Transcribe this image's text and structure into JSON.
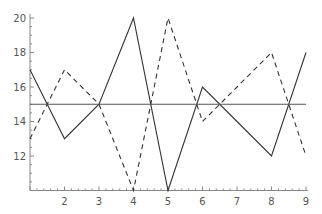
{
  "chart_data": {
    "type": "line",
    "title": "",
    "xlabel": "",
    "ylabel": "",
    "x": [
      1,
      2,
      3,
      4,
      5,
      6,
      7,
      8,
      9
    ],
    "series": [
      {
        "name": "solid",
        "style": "solid",
        "values": [
          17,
          13,
          15,
          20,
          10,
          16,
          14,
          12,
          18
        ]
      },
      {
        "name": "dashed",
        "style": "dashed",
        "values": [
          13,
          17,
          15,
          10,
          20,
          14,
          16,
          18,
          12
        ]
      },
      {
        "name": "mean",
        "style": "solid",
        "values": [
          15,
          15,
          15,
          15,
          15,
          15,
          15,
          15,
          15
        ]
      }
    ],
    "xticks": [
      2,
      3,
      4,
      5,
      6,
      7,
      8,
      9
    ],
    "yticks": [
      12,
      14,
      16,
      18,
      20
    ],
    "xlim": [
      1,
      9
    ],
    "ylim": [
      10,
      20
    ],
    "grid": false,
    "legend": "none"
  },
  "colors": {
    "line": "#333333",
    "axis": "#888888",
    "mean": "#555555"
  }
}
